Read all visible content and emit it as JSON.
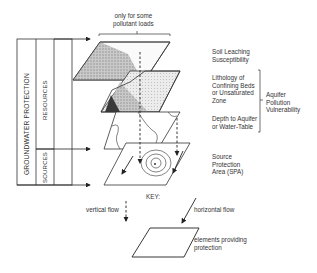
{
  "diagram": {
    "top_note": "only for some\npollutant loads",
    "sidebar": {
      "outer_label": "GROUNDWATER PROTECTION",
      "resources_label": "RESOURCES",
      "sources_label": "SOURCES"
    },
    "layers": [
      {
        "label": "Soil Leaching\nSusceptibility"
      },
      {
        "label": "Lithology of\nConfining Beds\nor Unsaturated\nZone"
      },
      {
        "label": "Depth to Aquifer\nor Water-Table"
      },
      {
        "label": "Source\nProtection\nArea (SPA)"
      }
    ],
    "bracket_label": "Aquifer\nPollution\nVulnerability",
    "key": {
      "title": "KEY:",
      "vertical_flow": "vertical flow",
      "horizontal_flow": "horizontal flow",
      "elements": "elements providing\nprotection"
    }
  }
}
